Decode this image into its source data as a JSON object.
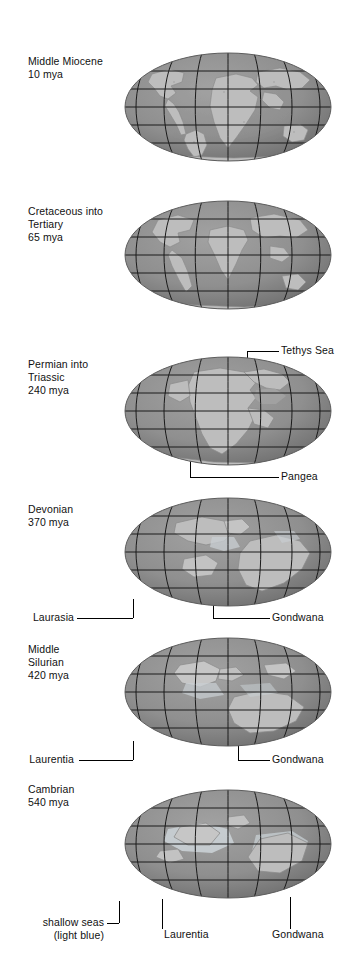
{
  "figure": {
    "title_semantic": "paleogeographic-reconstructions",
    "background_color": "#ffffff",
    "text_color": "#111111",
    "ocean_color": "#8f8f8f",
    "land_color": "#b9b9b9",
    "shallow_sea_color": "#cfd6da",
    "graticule_color": "#1a1a1a",
    "panel_count": 6
  },
  "panels": [
    {
      "id": "middle-miocene",
      "era_line1": "Middle Miocene",
      "era_line2": "10 mya",
      "era_line3": "",
      "annotations": []
    },
    {
      "id": "cretaceous-tertiary",
      "era_line1": "Cretaceous into",
      "era_line2": "Tertiary",
      "era_line3": "65 mya",
      "annotations": []
    },
    {
      "id": "permian-triassic",
      "era_line1": "Permian into",
      "era_line2": "Triassic",
      "era_line3": "240 mya",
      "annotations": [
        {
          "id": "tethys-sea",
          "label": "Tethys Sea",
          "side": "right"
        },
        {
          "id": "pangea",
          "label": "Pangea",
          "side": "right"
        }
      ]
    },
    {
      "id": "devonian",
      "era_line1": "Devonian",
      "era_line2": "370 mya",
      "era_line3": "",
      "annotations": [
        {
          "id": "laurasia",
          "label": "Laurasia",
          "side": "left"
        },
        {
          "id": "gondwana",
          "label": "Gondwana",
          "side": "right"
        }
      ]
    },
    {
      "id": "middle-silurian",
      "era_line1": "Middle",
      "era_line2": "Silurian",
      "era_line3": "420 mya",
      "annotations": [
        {
          "id": "laurentia",
          "label": "Laurentia",
          "side": "left"
        },
        {
          "id": "gondwana",
          "label": "Gondwana",
          "side": "right"
        }
      ]
    },
    {
      "id": "cambrian",
      "era_line1": "Cambrian",
      "era_line2": "540 mya",
      "era_line3": "",
      "annotations": [
        {
          "id": "shallow-seas",
          "label": "shallow seas",
          "label2": "(light blue)",
          "side": "left"
        },
        {
          "id": "laurentia",
          "label": "Laurentia",
          "side": "center"
        },
        {
          "id": "gondwana",
          "label": "Gondwana",
          "side": "right"
        }
      ]
    }
  ],
  "labels": {
    "p1_l1": "Middle Miocene",
    "p1_l2": "10 mya",
    "p2_l1": "Cretaceous into",
    "p2_l2": "Tertiary",
    "p2_l3": "65 mya",
    "p3_l1": "Permian into",
    "p3_l2": "Triassic",
    "p3_l3": "240 mya",
    "p4_l1": "Devonian",
    "p4_l2": "370 mya",
    "p5_l1": "Middle",
    "p5_l2": "Silurian",
    "p5_l3": "420 mya",
    "p6_l1": "Cambrian",
    "p6_l2": "540 mya",
    "a_tethys": "Tethys Sea",
    "a_pangea": "Pangea",
    "a_laurasia": "Laurasia",
    "a_gondwana_4": "Gondwana",
    "a_laurentia_5": "Laurentia",
    "a_gondwana_5": "Gondwana",
    "a_shallow_1": "shallow seas",
    "a_shallow_2": "(light blue)",
    "a_laurentia_6": "Laurentia",
    "a_gondwana_6": "Gondwana"
  }
}
